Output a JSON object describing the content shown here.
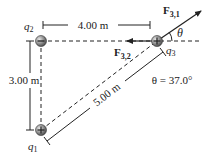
{
  "charges": {
    "q1": {
      "label_main": "q",
      "label_sub": "1",
      "sign": "+"
    },
    "q2": {
      "label_main": "q",
      "label_sub": "2",
      "sign": "−"
    },
    "q3": {
      "label_main": "q",
      "label_sub": "3",
      "sign": "+"
    }
  },
  "dimensions": {
    "horizontal": "4.00 m",
    "vertical": "3.00 m",
    "diagonal": "5.00 m"
  },
  "forces": {
    "f31": {
      "main": "F",
      "sub": "3,1"
    },
    "f32": {
      "main": "F",
      "sub": "3,2"
    }
  },
  "angle": {
    "symbol": "θ",
    "equation": "θ = 37.0°"
  },
  "colors": {
    "line": "#222222",
    "charge_fill": "#8a8a8a"
  }
}
